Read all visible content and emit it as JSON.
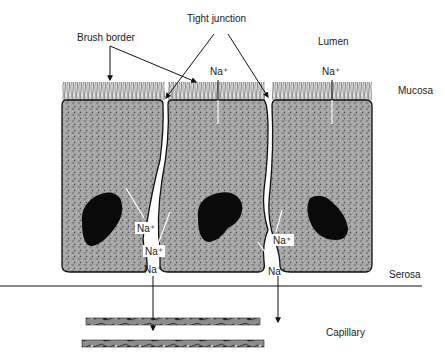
{
  "diagram": {
    "labels": {
      "tight_junction": "Tight junction",
      "brush_border": "Brush border",
      "lumen": "Lumen",
      "mucosa": "Mucosa",
      "serosa": "Serosa",
      "capillary": "Capillary"
    },
    "ions": {
      "lumen_left": "Na⁺",
      "lumen_right": "Na⁺",
      "gap1_upper": "Na⁺",
      "gap1_middle": "Na⁺",
      "gap1_lower": "Na⁺",
      "gap2_upper": "Na⁺",
      "gap2_lower": "Na⁺"
    },
    "colors": {
      "ink": "#111111",
      "cytoplasm": "#9a9a9a",
      "background": "#ffffff"
    }
  }
}
